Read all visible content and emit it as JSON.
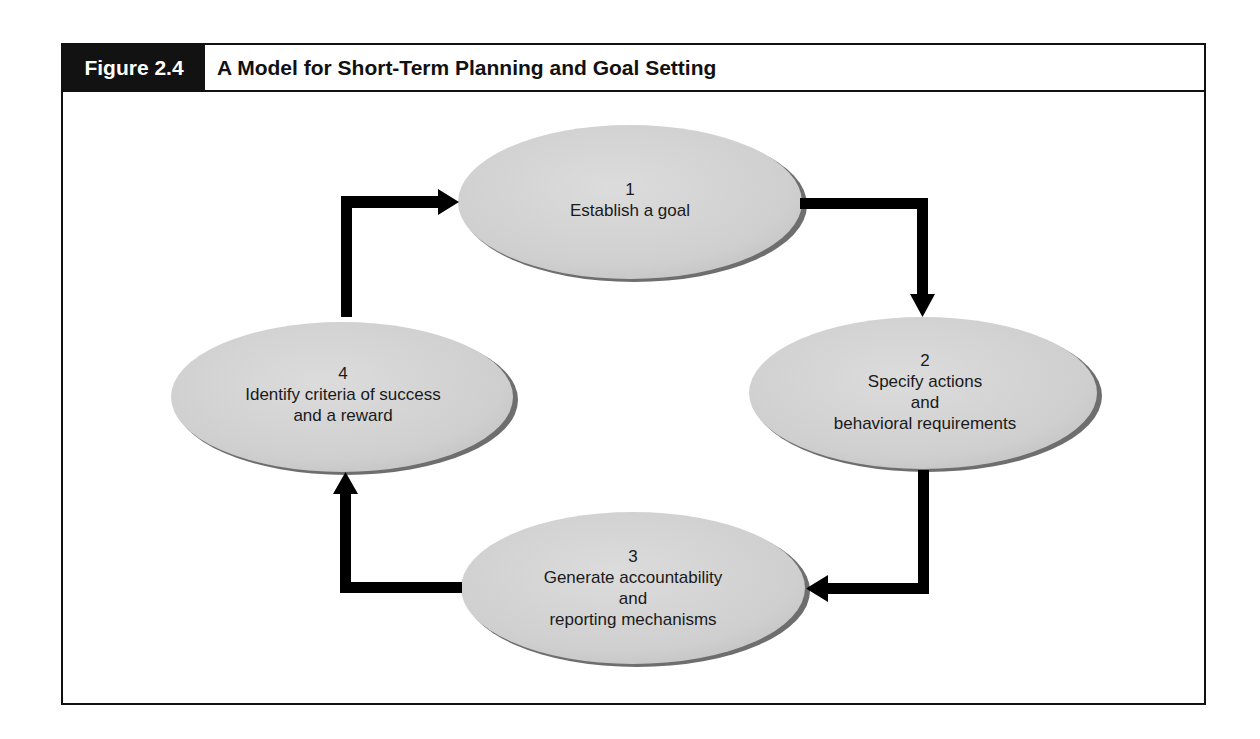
{
  "figure": {
    "label": "Figure 2.4",
    "title": "A Model for Short-Term Planning and Goal Setting"
  },
  "colors": {
    "frame": "#111111",
    "label_bg": "#121212",
    "node_fill": "#d4d4d4",
    "node_shadow": "#6e6e6e",
    "arrow": "#000000"
  },
  "nodes": [
    {
      "number": "1",
      "lines": [
        "Establish a goal"
      ]
    },
    {
      "number": "2",
      "lines": [
        "Specify actions",
        "and",
        "behavioral requirements"
      ]
    },
    {
      "number": "3",
      "lines": [
        "Generate accountability",
        "and",
        "reporting mechanisms"
      ]
    },
    {
      "number": "4",
      "lines": [
        "Identify criteria of success",
        "and a reward"
      ]
    }
  ],
  "edges": [
    {
      "from": "1",
      "to": "2"
    },
    {
      "from": "2",
      "to": "3"
    },
    {
      "from": "3",
      "to": "4"
    },
    {
      "from": "4",
      "to": "1"
    }
  ]
}
